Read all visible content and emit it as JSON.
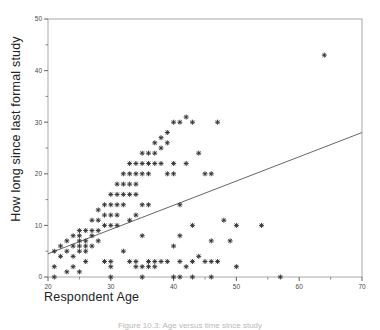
{
  "figure": {
    "caption": "Figure 10.3: Age versus time since study",
    "axis_title_x": "Respondent Age",
    "axis_title_y": "How long since last formal study"
  },
  "chart_data": {
    "type": "scatter",
    "title": "",
    "xlabel": "Respondent Age",
    "ylabel": "How long since last formal study",
    "xlim": [
      20,
      70
    ],
    "ylim": [
      0,
      50
    ],
    "xticks": [
      20,
      30,
      40,
      50,
      60,
      70
    ],
    "yticks": [
      0,
      10,
      20,
      30,
      40,
      50
    ],
    "xminor_step": 5,
    "yminor_step": 5,
    "grid": false,
    "legend": "none",
    "marker": "plus",
    "marker_color": "#333333",
    "frame_color": "#a8a8a8",
    "trendline": {
      "label": "linear fit",
      "color": "#555555",
      "x": [
        20,
        70
      ],
      "y": [
        4.5,
        28.0
      ]
    },
    "points": [
      [
        21,
        0
      ],
      [
        21,
        2
      ],
      [
        21,
        5
      ],
      [
        22,
        6
      ],
      [
        22,
        4
      ],
      [
        23,
        7
      ],
      [
        23,
        5
      ],
      [
        23,
        1
      ],
      [
        24,
        8
      ],
      [
        24,
        6
      ],
      [
        24,
        4
      ],
      [
        24,
        2
      ],
      [
        25,
        9
      ],
      [
        25,
        8
      ],
      [
        25,
        7
      ],
      [
        25,
        6
      ],
      [
        25,
        5
      ],
      [
        25,
        1
      ],
      [
        26,
        9
      ],
      [
        26,
        7
      ],
      [
        26,
        6
      ],
      [
        26,
        5
      ],
      [
        26,
        3
      ],
      [
        27,
        11
      ],
      [
        27,
        9
      ],
      [
        27,
        8
      ],
      [
        27,
        6
      ],
      [
        28,
        13
      ],
      [
        28,
        11
      ],
      [
        28,
        9
      ],
      [
        28,
        7
      ],
      [
        29,
        14
      ],
      [
        29,
        12
      ],
      [
        29,
        10
      ],
      [
        29,
        3
      ],
      [
        30,
        16
      ],
      [
        30,
        14
      ],
      [
        30,
        12
      ],
      [
        30,
        10
      ],
      [
        30,
        3
      ],
      [
        30,
        2
      ],
      [
        30,
        0
      ],
      [
        31,
        18
      ],
      [
        31,
        16
      ],
      [
        31,
        14
      ],
      [
        31,
        12
      ],
      [
        31,
        10
      ],
      [
        32,
        20
      ],
      [
        32,
        18
      ],
      [
        32,
        16
      ],
      [
        32,
        14
      ],
      [
        32,
        5
      ],
      [
        33,
        22
      ],
      [
        33,
        20
      ],
      [
        33,
        18
      ],
      [
        33,
        16
      ],
      [
        33,
        11
      ],
      [
        33,
        3
      ],
      [
        34,
        22
      ],
      [
        34,
        20
      ],
      [
        34,
        18
      ],
      [
        34,
        16
      ],
      [
        34,
        12
      ],
      [
        34,
        3
      ],
      [
        34,
        2
      ],
      [
        35,
        24
      ],
      [
        35,
        22
      ],
      [
        35,
        20
      ],
      [
        35,
        14
      ],
      [
        35,
        8
      ],
      [
        35,
        2
      ],
      [
        35,
        0
      ],
      [
        36,
        24
      ],
      [
        36,
        22
      ],
      [
        36,
        20
      ],
      [
        36,
        14
      ],
      [
        36,
        3
      ],
      [
        36,
        2
      ],
      [
        37,
        26
      ],
      [
        37,
        24
      ],
      [
        37,
        22
      ],
      [
        37,
        3
      ],
      [
        37,
        2
      ],
      [
        38,
        27
      ],
      [
        38,
        25
      ],
      [
        38,
        22
      ],
      [
        38,
        3
      ],
      [
        39,
        28
      ],
      [
        39,
        26
      ],
      [
        39,
        20
      ],
      [
        39,
        3
      ],
      [
        40,
        30
      ],
      [
        40,
        22
      ],
      [
        40,
        20
      ],
      [
        40,
        6
      ],
      [
        40,
        0
      ],
      [
        41,
        30
      ],
      [
        41,
        14
      ],
      [
        41,
        8
      ],
      [
        41,
        3
      ],
      [
        41,
        0
      ],
      [
        42,
        31
      ],
      [
        42,
        22
      ],
      [
        42,
        2
      ],
      [
        43,
        30
      ],
      [
        43,
        10
      ],
      [
        43,
        3
      ],
      [
        43,
        0
      ],
      [
        44,
        24
      ],
      [
        44,
        4
      ],
      [
        45,
        20
      ],
      [
        45,
        3
      ],
      [
        46,
        20
      ],
      [
        46,
        7
      ],
      [
        46,
        3
      ],
      [
        46,
        0
      ],
      [
        47,
        30
      ],
      [
        47,
        3
      ],
      [
        48,
        11
      ],
      [
        49,
        7
      ],
      [
        50,
        10
      ],
      [
        50,
        2
      ],
      [
        54,
        10
      ],
      [
        57,
        0
      ],
      [
        64,
        43
      ]
    ]
  }
}
